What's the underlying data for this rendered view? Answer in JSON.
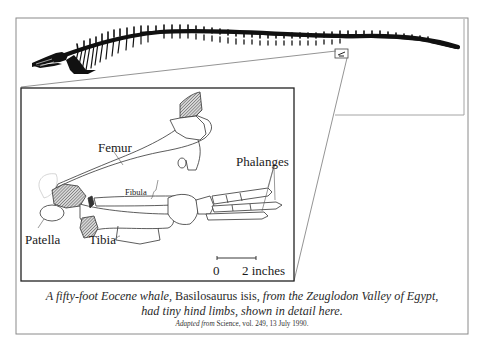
{
  "figure": {
    "labels": {
      "femur": "Femur",
      "fibula": "Fibula",
      "phalanges": "Phalanges",
      "patella": "Patella",
      "tibia": "Tibia"
    },
    "scale_bar": {
      "start": "0",
      "end": "2 inches"
    }
  },
  "caption": {
    "line1": [
      {
        "text": "A fifty-foot Eocene whale, ",
        "italic": true
      },
      {
        "text": "Basilosaurus isis",
        "italic": false
      },
      {
        "text": ", from the Zeugludon Valley of Egypt,",
        "italic": true
      }
    ],
    "line1_part_a": "A fifty-foot Eocene whale,",
    "line1_part_b": "Basilosaurus isis,",
    "line1_part_c": "from the Zeuglodon Valley of Egypt,",
    "line2": "had tiny hind limbs, shown in detail here.",
    "credit_prefix": "Adapted from",
    "credit_source": "Science, vol. 249, 13 July 1990."
  },
  "colors": {
    "frame": "#8a8a8a",
    "inset_border": "#222222",
    "skeleton": "#111111",
    "hatch": "#555555"
  }
}
